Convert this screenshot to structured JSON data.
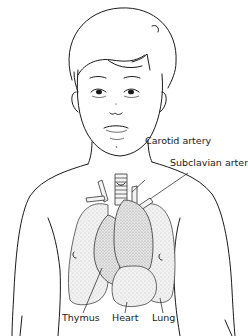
{
  "figure": {
    "labels": {
      "carotid_artery": "Carotid artery",
      "subclavian_artery": "Subclavian artery",
      "thymus": "Thymus",
      "heart": "Heart",
      "lung": "Lung"
    }
  }
}
